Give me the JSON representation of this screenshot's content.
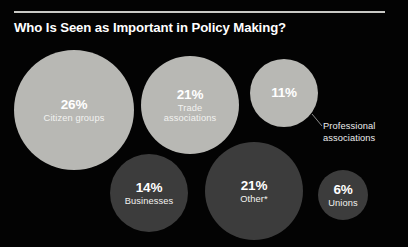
{
  "header": {
    "title": "Who Is Seen as Important in Policy Making?"
  },
  "colors": {
    "background": "#030303",
    "rule": "#c9c9c5",
    "bubble_light": "#b8b8b4",
    "bubble_dark": "#3c3c3c",
    "text_light": "#ffffff",
    "text_on_light": "#ffffff",
    "leader_line": "#9a9a98"
  },
  "bubbles": [
    {
      "id": "citizen-groups",
      "value": "26%",
      "label": "Citizen groups",
      "percent": 26,
      "tone": "light",
      "cx": 74,
      "cy": 110,
      "r": 60
    },
    {
      "id": "trade-associations",
      "value": "21%",
      "label": "Trade\nassociations",
      "percent": 21,
      "tone": "light",
      "cx": 190,
      "cy": 105,
      "r": 49
    },
    {
      "id": "professional-associations",
      "value": "11%",
      "label": "",
      "percent": 11,
      "tone": "light",
      "cx": 284,
      "cy": 93,
      "r": 34
    },
    {
      "id": "businesses",
      "value": "14%",
      "label": "Businesses",
      "percent": 14,
      "tone": "dark",
      "cx": 149,
      "cy": 193,
      "r": 39
    },
    {
      "id": "other",
      "value": "21%",
      "label": "Other*",
      "percent": 21,
      "tone": "dark",
      "cx": 254,
      "cy": 191,
      "r": 49
    },
    {
      "id": "unions",
      "value": "6%",
      "label": "Unions",
      "percent": 6,
      "tone": "dark",
      "cx": 343,
      "cy": 195,
      "r": 25
    }
  ],
  "callout": {
    "label": "Professional\nassociations",
    "x": 323,
    "y": 121,
    "line": {
      "x1": 312,
      "y1": 114,
      "x2": 322,
      "y2": 126
    }
  },
  "chart_data": {
    "type": "bubble",
    "title": "Who Is Seen as Important in Policy Making?",
    "xlabel": "",
    "ylabel": "",
    "unit": "percent",
    "categories": [
      "Citizen groups",
      "Trade associations",
      "Professional associations",
      "Businesses",
      "Other*",
      "Unions"
    ],
    "values": [
      26,
      21,
      11,
      14,
      21,
      6
    ],
    "labels": [
      "26%",
      "21%",
      "11%",
      "14%",
      "21%",
      "6%"
    ],
    "grid": false,
    "legend": "none"
  }
}
